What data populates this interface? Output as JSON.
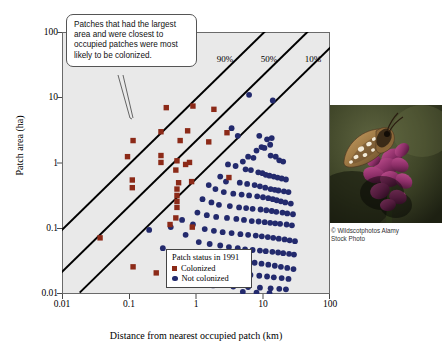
{
  "chart_data": {
    "type": "scatter",
    "title": "",
    "xlabel": "Distance from nearest occupied patch (km)",
    "ylabel": "Patch area (ha)",
    "xscale": "log",
    "yscale": "log",
    "xlim": [
      0.01,
      100
    ],
    "ylim": [
      0.01,
      100
    ],
    "xticks": [
      "0.01",
      "0.1",
      "1",
      "10",
      "100"
    ],
    "yticks": [
      "100",
      "10",
      "1",
      "0.1",
      "0.01"
    ],
    "grid": false,
    "legend": {
      "title": "Patch status in 1991",
      "position": "bottom-center",
      "entries": [
        {
          "label": "Colonized",
          "marker": "square",
          "color": "#8c2a18"
        },
        {
          "label": "Not colonized",
          "marker": "circle",
          "color": "#232a6d"
        }
      ]
    },
    "annotations": [
      {
        "name": "callout",
        "text": "Patches that had the largest area and were closest to occupied patches were most likely to be colonized."
      }
    ],
    "isoclines": [
      {
        "label": "90%",
        "x_at_y1": 0.105
      },
      {
        "label": "50%",
        "x_at_y1": 0.46
      },
      {
        "label": "10%",
        "x_at_y1": 1.75
      }
    ],
    "series": [
      {
        "name": "Colonized",
        "marker": "square",
        "color": "#8c2a18",
        "points": [
          [
            0.36,
            7.0
          ],
          [
            0.9,
            7.4
          ],
          [
            1.85,
            6.6
          ],
          [
            0.3,
            3.0
          ],
          [
            0.75,
            3.1
          ],
          [
            2.9,
            2.9
          ],
          [
            0.115,
            2.2
          ],
          [
            0.58,
            2.2
          ],
          [
            1.55,
            2.1
          ],
          [
            0.095,
            1.25
          ],
          [
            0.3,
            1.3
          ],
          [
            0.3,
            1.02
          ],
          [
            0.52,
            1.08
          ],
          [
            0.8,
            1.02
          ],
          [
            0.7,
            0.95
          ],
          [
            0.5,
            0.78
          ],
          [
            0.112,
            0.55
          ],
          [
            0.112,
            0.42
          ],
          [
            0.55,
            0.5
          ],
          [
            0.86,
            0.52
          ],
          [
            0.52,
            0.4
          ],
          [
            0.52,
            0.32
          ],
          [
            0.52,
            0.26
          ],
          [
            0.52,
            0.21
          ],
          [
            0.5,
            0.145
          ],
          [
            0.41,
            0.115
          ],
          [
            3.1,
            0.6
          ],
          [
            0.88,
            0.105
          ],
          [
            0.037,
            0.072
          ],
          [
            0.115,
            0.026
          ],
          [
            0.255,
            0.021
          ]
        ]
      },
      {
        "name": "Not colonized",
        "marker": "circle",
        "color": "#232a6d",
        "points": [
          [
            6.2,
            11.0
          ],
          [
            14.0,
            9.0
          ],
          [
            3.4,
            3.4
          ],
          [
            4.2,
            2.6
          ],
          [
            8.8,
            2.6
          ],
          [
            11.5,
            2.3
          ],
          [
            13.5,
            2.4
          ],
          [
            12.8,
            1.9
          ],
          [
            9.5,
            1.75
          ],
          [
            10.5,
            1.7
          ],
          [
            8.0,
            1.55
          ],
          [
            6.0,
            1.25
          ],
          [
            7.2,
            1.2
          ],
          [
            5.0,
            1.05
          ],
          [
            13.0,
            1.3
          ],
          [
            15.5,
            1.25
          ],
          [
            17.5,
            1.1
          ],
          [
            20.0,
            1.05
          ],
          [
            3.0,
            0.95
          ],
          [
            3.9,
            0.9
          ],
          [
            5.5,
            0.8
          ],
          [
            6.6,
            0.78
          ],
          [
            8.5,
            0.72
          ],
          [
            9.8,
            0.7
          ],
          [
            11.0,
            0.66
          ],
          [
            12.5,
            0.64
          ],
          [
            14.5,
            0.62
          ],
          [
            16.5,
            0.6
          ],
          [
            19.0,
            0.58
          ],
          [
            22.0,
            0.56
          ],
          [
            2.3,
            0.62
          ],
          [
            2.8,
            0.52
          ],
          [
            4.5,
            0.5
          ],
          [
            5.8,
            0.48
          ],
          [
            7.5,
            0.46
          ],
          [
            9.0,
            0.44
          ],
          [
            10.8,
            0.42
          ],
          [
            13.0,
            0.4
          ],
          [
            15.0,
            0.39
          ],
          [
            17.0,
            0.38
          ],
          [
            20.5,
            0.37
          ],
          [
            24.0,
            0.36
          ],
          [
            1.55,
            0.46
          ],
          [
            1.95,
            0.4
          ],
          [
            2.6,
            0.36
          ],
          [
            3.6,
            0.34
          ],
          [
            4.8,
            0.33
          ],
          [
            6.2,
            0.32
          ],
          [
            8.2,
            0.31
          ],
          [
            10.0,
            0.3
          ],
          [
            12.0,
            0.29
          ],
          [
            14.0,
            0.28
          ],
          [
            16.0,
            0.27
          ],
          [
            18.5,
            0.26
          ],
          [
            21.5,
            0.25
          ],
          [
            26.0,
            0.24
          ],
          [
            1.25,
            0.28
          ],
          [
            1.7,
            0.25
          ],
          [
            2.2,
            0.23
          ],
          [
            3.2,
            0.22
          ],
          [
            4.4,
            0.21
          ],
          [
            5.6,
            0.205
          ],
          [
            7.0,
            0.2
          ],
          [
            9.2,
            0.195
          ],
          [
            11.2,
            0.19
          ],
          [
            13.5,
            0.185
          ],
          [
            15.8,
            0.18
          ],
          [
            19.5,
            0.175
          ],
          [
            23.0,
            0.17
          ],
          [
            28.0,
            0.165
          ],
          [
            1.05,
            0.175
          ],
          [
            1.45,
            0.16
          ],
          [
            2.0,
            0.15
          ],
          [
            2.9,
            0.145
          ],
          [
            4.0,
            0.14
          ],
          [
            5.2,
            0.135
          ],
          [
            6.8,
            0.13
          ],
          [
            8.6,
            0.128
          ],
          [
            10.6,
            0.125
          ],
          [
            12.8,
            0.122
          ],
          [
            15.2,
            0.12
          ],
          [
            18.0,
            0.118
          ],
          [
            22.5,
            0.115
          ],
          [
            27.0,
            0.112
          ],
          [
            0.62,
            0.135
          ],
          [
            0.9,
            0.115
          ],
          [
            1.35,
            0.098
          ],
          [
            1.85,
            0.092
          ],
          [
            2.5,
            0.088
          ],
          [
            3.4,
            0.085
          ],
          [
            4.6,
            0.082
          ],
          [
            6.0,
            0.08
          ],
          [
            7.8,
            0.078
          ],
          [
            9.6,
            0.076
          ],
          [
            11.8,
            0.074
          ],
          [
            14.2,
            0.072
          ],
          [
            17.2,
            0.07
          ],
          [
            21.0,
            0.068
          ],
          [
            25.0,
            0.066
          ],
          [
            30.0,
            0.064
          ],
          [
            0.42,
            0.105
          ],
          [
            0.7,
            0.08
          ],
          [
            1.1,
            0.062
          ],
          [
            1.6,
            0.058
          ],
          [
            2.3,
            0.055
          ],
          [
            3.1,
            0.052
          ],
          [
            4.2,
            0.05
          ],
          [
            5.4,
            0.048
          ],
          [
            7.0,
            0.047
          ],
          [
            9.0,
            0.046
          ],
          [
            11.0,
            0.045
          ],
          [
            13.8,
            0.044
          ],
          [
            16.8,
            0.043
          ],
          [
            20.0,
            0.042
          ],
          [
            24.5,
            0.041
          ],
          [
            29.0,
            0.04
          ],
          [
            0.2,
            0.095
          ],
          [
            0.95,
            0.04
          ],
          [
            1.5,
            0.036
          ],
          [
            2.1,
            0.034
          ],
          [
            3.0,
            0.033
          ],
          [
            4.0,
            0.032
          ],
          [
            5.5,
            0.031
          ],
          [
            7.5,
            0.03
          ],
          [
            9.5,
            0.029
          ],
          [
            12.0,
            0.028
          ],
          [
            15.0,
            0.027
          ],
          [
            18.5,
            0.026
          ],
          [
            23.0,
            0.025
          ],
          [
            28.5,
            0.024
          ],
          [
            0.32,
            0.05
          ],
          [
            0.56,
            0.036
          ],
          [
            1.3,
            0.022
          ],
          [
            2.6,
            0.021
          ],
          [
            4.5,
            0.02
          ],
          [
            6.5,
            0.0195
          ],
          [
            8.8,
            0.019
          ],
          [
            11.5,
            0.0185
          ],
          [
            14.5,
            0.018
          ],
          [
            19.0,
            0.0175
          ],
          [
            24.0,
            0.017
          ],
          [
            0.72,
            0.0145
          ],
          [
            1.8,
            0.0135
          ],
          [
            3.6,
            0.013
          ],
          [
            6.0,
            0.0128
          ],
          [
            9.0,
            0.0125
          ],
          [
            13.0,
            0.0122
          ],
          [
            17.5,
            0.012
          ],
          [
            22.0,
            0.0118
          ],
          [
            5.0,
            0.0108
          ],
          [
            8.0,
            0.0105
          ],
          [
            12.5,
            0.0103
          ],
          [
            1.15,
            0.0072
          ]
        ]
      }
    ]
  },
  "photo": {
    "alt": "Silver-spotted skipper butterfly resting on purple flowers",
    "credit_line1": "© Wildscotphotos Alamy",
    "credit_line2": "Stock Photo"
  }
}
